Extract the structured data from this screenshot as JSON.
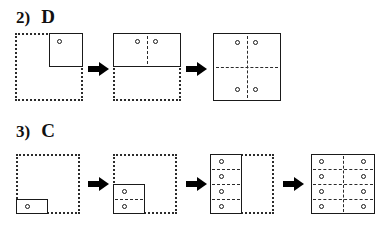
{
  "page": {
    "background": "#ffffff",
    "ink": "#1a1a1a",
    "width": 385,
    "height": 228
  },
  "rows": [
    {
      "id": "row-2",
      "number_label": "2)",
      "answer_label": "D",
      "grid": {
        "cols": 2,
        "rows": 2
      },
      "steps": [
        {
          "name": "step-1",
          "filled_cells": 1,
          "dots": 1,
          "description": "one solid cell in top-right quadrant with one circle"
        },
        {
          "name": "step-2",
          "filled_cells": 2,
          "dots": 2,
          "description": "solid rectangle across top row with two circles"
        },
        {
          "name": "step-3",
          "filled_cells": 4,
          "dots": 4,
          "description": "full solid square with four circles"
        }
      ],
      "arrows": 2
    },
    {
      "id": "row-3",
      "number_label": "3)",
      "answer_label": "C",
      "grid": {
        "cols": 2,
        "rows": 4
      },
      "steps": [
        {
          "name": "step-1",
          "filled_cells": 1,
          "dots": 1,
          "description": "one solid cell at bottom-left with one circle"
        },
        {
          "name": "step-2",
          "filled_cells": 2,
          "dots": 2,
          "description": "solid block of two stacked cells bottom-left with two circles"
        },
        {
          "name": "step-3",
          "filled_cells": 4,
          "dots": 4,
          "description": "solid left column of four cells with four circles"
        },
        {
          "name": "step-4",
          "filled_cells": 8,
          "dots": 8,
          "description": "full solid 2x4 grid with eight circles"
        }
      ],
      "arrows": 3
    }
  ]
}
